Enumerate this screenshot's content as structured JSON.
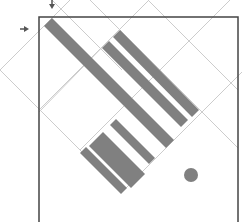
{
  "diagram": {
    "colors": {
      "background": "#ffffff",
      "frame": "#444444",
      "grid": "#cccccc",
      "bars": "#808080",
      "dot": "#808080",
      "arrows": "#555555"
    },
    "frame": {
      "x": 39,
      "y": 17,
      "width": 199,
      "height": 215
    },
    "markers": [
      {
        "name": "down-arrow-marker",
        "x": 52,
        "y": 5,
        "direction": "down"
      },
      {
        "name": "right-arrow-marker",
        "x": 24,
        "y": 29,
        "direction": "right"
      }
    ],
    "grid_lines": [
      {
        "x1": 0,
        "y1": 70,
        "x2": 70,
        "y2": 0
      },
      {
        "x1": 39,
        "y1": 110,
        "x2": 149,
        "y2": 0
      },
      {
        "x1": 80,
        "y1": 150,
        "x2": 230,
        "y2": 0
      },
      {
        "x1": 122,
        "y1": 192,
        "x2": 242,
        "y2": 72
      },
      {
        "x1": 0,
        "y1": 70,
        "x2": 122,
        "y2": 192
      },
      {
        "x1": 52,
        "y1": 0,
        "x2": 122,
        "y2": 70
      },
      {
        "x1": 90,
        "y1": 0,
        "x2": 238,
        "y2": 148
      },
      {
        "x1": 148,
        "y1": 0,
        "x2": 238,
        "y2": 90
      },
      {
        "x1": 122,
        "y1": 192,
        "x2": 238,
        "y2": 76
      },
      {
        "x1": 39,
        "y1": 112,
        "x2": 119,
        "y2": 30
      }
    ],
    "bars": [
      {
        "points": "44,26 52,18 174,140 166,148"
      },
      {
        "points": "113,37 120,30 199,110 192,117"
      },
      {
        "points": "102,48 109,41 188,120 181,127"
      },
      {
        "points": "110,125 116,119 155,158 149,164"
      },
      {
        "points": "89,146 103,132 145,174 131,188"
      },
      {
        "points": "80,153 86,147 127,188 121,194"
      }
    ],
    "dot": {
      "cx": 191,
      "cy": 175,
      "r": 7
    }
  }
}
